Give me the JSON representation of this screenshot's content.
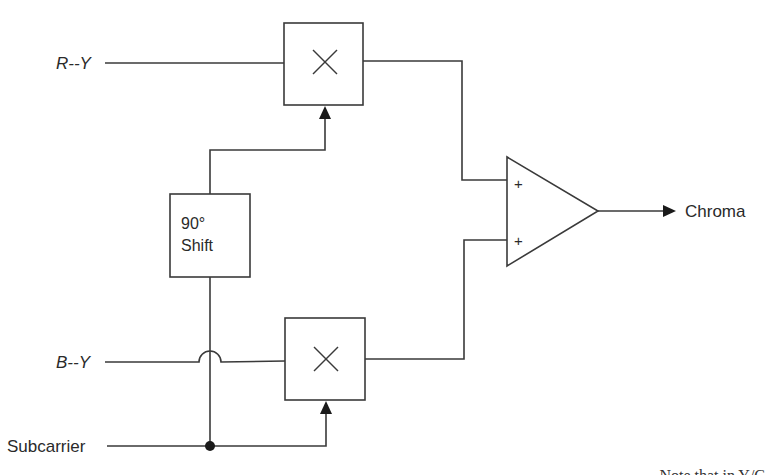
{
  "diagram": {
    "type": "block-diagram",
    "inputs": {
      "r_minus_y": "R--Y",
      "b_minus_y": "B--Y",
      "subcarrier": "Subcarrier"
    },
    "blocks": {
      "top_multiplier": {
        "symbol": "×"
      },
      "bottom_multiplier": {
        "symbol": "×"
      },
      "phase_shift": {
        "line1": "90°",
        "line2": "Shift"
      },
      "summer": {
        "input_top_sign": "+",
        "input_bottom_sign": "+"
      }
    },
    "output": {
      "label": "Chroma"
    },
    "colors": {
      "line": "#3a3a3a",
      "text": "#2a2a2a",
      "background": "#ffffff"
    }
  },
  "caption": {
    "visible_fragment": "Note that in Y/C"
  }
}
